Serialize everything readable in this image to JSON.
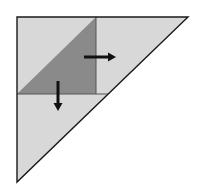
{
  "diagram": {
    "colors": {
      "light_fill": "#d8d8d8",
      "dark_fill": "#8a8a8a",
      "stroke": "#1a1a1a",
      "arrow": "#111111",
      "background": "#ffffff"
    },
    "outer_triangle": {
      "points": [
        [
          17,
          17
        ],
        [
          188,
          17
        ],
        [
          17,
          182
        ]
      ]
    },
    "dark_triangle": {
      "points": [
        [
          17,
          94
        ],
        [
          96,
          17
        ],
        [
          96,
          94
        ]
      ]
    },
    "divider_vertical": {
      "x": 96,
      "y1": 17,
      "y2": 94
    },
    "divider_horizontal": {
      "y": 94,
      "x1": 17,
      "x2": 108
    },
    "arrows": [
      {
        "name": "right-arrow",
        "direction": "right",
        "x1": 84,
        "y1": 57,
        "x2": 116,
        "y2": 57
      },
      {
        "name": "down-arrow",
        "direction": "down",
        "x1": 58,
        "y1": 81,
        "x2": 58,
        "y2": 111
      }
    ]
  }
}
